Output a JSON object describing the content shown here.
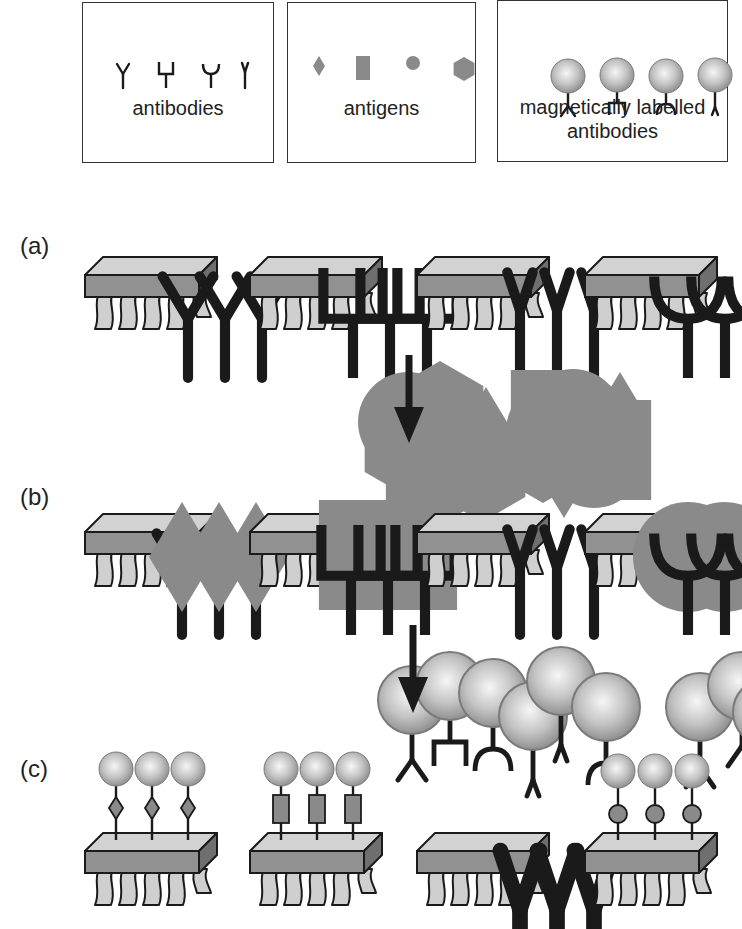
{
  "legend": [
    {
      "id": "antibodies",
      "label": "antibodies",
      "items": [
        "antibody-y",
        "antibody-square",
        "antibody-cup",
        "antibody-narrow"
      ]
    },
    {
      "id": "antigens",
      "label": "antigens",
      "items": [
        "antigen-diamond",
        "antigen-rectangle",
        "antigen-circle",
        "antigen-hexagon"
      ]
    },
    {
      "id": "magnetic",
      "label_line1": "magnetically labelled",
      "label_line2": "antibodies",
      "items": [
        "mag-antibody-y",
        "mag-antibody-square",
        "mag-antibody-cup",
        "mag-antibody-narrow"
      ]
    }
  ],
  "rows": [
    {
      "label": "(a)",
      "description": "sensors functionalised with antibodies",
      "chips": [
        {
          "receptor": "antibody-y",
          "bound": "none"
        },
        {
          "receptor": "antibody-square",
          "bound": "none"
        },
        {
          "receptor": "antibody-narrow",
          "bound": "none"
        },
        {
          "receptor": "antibody-cup",
          "bound": "none"
        }
      ]
    },
    {
      "label": "(b)",
      "description": "antigens bind to matching antibodies",
      "chips": [
        {
          "receptor": "antibody-y",
          "bound": "antigen-diamond"
        },
        {
          "receptor": "antibody-square",
          "bound": "antigen-rectangle"
        },
        {
          "receptor": "antibody-narrow",
          "bound": "none"
        },
        {
          "receptor": "antibody-cup",
          "bound": "antigen-circle"
        }
      ]
    },
    {
      "label": "(c)",
      "description": "magnetically labelled antibodies bind to captured antigens",
      "chips": [
        {
          "receptor": "antibody-y",
          "bound": "antigen-diamond + magnetic-bead"
        },
        {
          "receptor": "antibody-square",
          "bound": "antigen-rectangle + magnetic-bead"
        },
        {
          "receptor": "antibody-narrow",
          "bound": "none"
        },
        {
          "receptor": "antibody-cup",
          "bound": "antigen-circle + magnetic-bead"
        }
      ]
    }
  ],
  "steps": [
    {
      "from": "(a)",
      "to": "(b)",
      "added": "antigens mixture"
    },
    {
      "from": "(b)",
      "to": "(c)",
      "added": "magnetically labelled antibodies mixture"
    }
  ],
  "colors": {
    "line": "#1a1a1a",
    "chip_top": "#cfcfcf",
    "chip_front": "#8f8f8f",
    "chip_side": "#6e6e6e",
    "chip_legs": "#cccccc",
    "antigen": "#8a8a8a",
    "bead_light": "#f4f4f4",
    "bead_dark": "#8e8e8e"
  }
}
